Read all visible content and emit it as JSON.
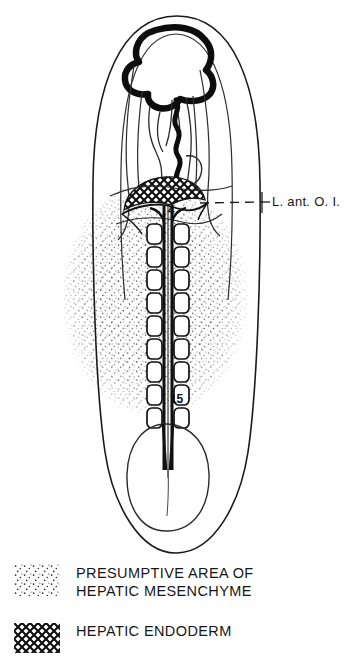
{
  "figure": {
    "orientation": "dorsal view, anterior at top",
    "background_color": "#ffffff",
    "ink_color": "#111111"
  },
  "callout": {
    "label": "L. ant. O. I.",
    "leader_style": "dashed",
    "points_to": "hepatic-endoderm-patch"
  },
  "somite_markers": [
    {
      "id": "somite-number-4",
      "label": "4"
    },
    {
      "id": "somite-number-15",
      "label": "15"
    }
  ],
  "legend": {
    "items": [
      {
        "swatch": "stipple-swatch",
        "pattern": "stipple",
        "label": "PRESUMPTIVE AREA OF\nHEPATIC MESENCHYME"
      },
      {
        "swatch": "crosshatch-swatch",
        "pattern": "cross-hatch",
        "label": "HEPATIC ENDODERM"
      }
    ]
  },
  "structures": [
    {
      "name": "embryo-outline",
      "description": "outer ovoid blastoderm margin"
    },
    {
      "name": "brain-vesicle",
      "description": "heavy black anterior neural outline"
    },
    {
      "name": "heart-tube",
      "description": "wavy median tube caudal to brain"
    },
    {
      "name": "foregut-pocket",
      "description": "paired curved lines in head region"
    },
    {
      "name": "neural-tube",
      "description": "dark median axial line"
    },
    {
      "name": "somite-column",
      "description": "paired rounded blocks flanking neural tube"
    },
    {
      "name": "hepatic-endoderm-patch",
      "description": "cross-hatched dome straddling midline"
    },
    {
      "name": "hepatic-mesenchyme-area",
      "description": "stippled ovoid field"
    },
    {
      "name": "tail-bud",
      "description": "caudal rounded primitive streak region"
    }
  ]
}
